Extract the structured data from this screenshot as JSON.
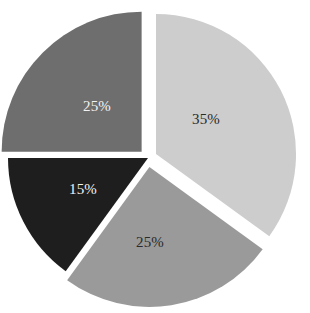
{
  "chart_data": {
    "type": "pie",
    "title": "",
    "subtitle": "",
    "xlabel": "",
    "ylabel": "",
    "legend": "none",
    "grid": false,
    "background_color": "#ffffff",
    "center": {
      "x": 148,
      "y": 158
    },
    "radius": 140,
    "start_angle_deg": 0,
    "direction": "clockwise",
    "exploded": true,
    "categories": [
      "35%",
      "25%",
      "15%",
      "25%"
    ],
    "values": [
      35,
      25,
      15,
      25
    ],
    "labels": [
      "35%",
      "25%",
      "15%",
      "25%"
    ],
    "slices": [
      {
        "label": "35%",
        "value": 35,
        "color": "#cdcdcd",
        "label_color": "#2a2a2a",
        "start_deg": 0,
        "end_deg": 126,
        "explode_deg": 63,
        "explode_px": 9,
        "label_x": 206,
        "label_y": 124,
        "position": "right"
      },
      {
        "label": "25%",
        "value": 25,
        "color": "#9a9a9a",
        "label_color": "#2a2a2a",
        "start_deg": 126,
        "end_deg": 216,
        "explode_deg": 171,
        "explode_px": 9,
        "label_x": 150,
        "label_y": 247,
        "position": "bottom"
      },
      {
        "label": "15%",
        "value": 15,
        "color": "#1e1e1e",
        "label_color": "#f2f2f2",
        "start_deg": 216,
        "end_deg": 270,
        "explode_deg": 243,
        "explode_px": 0,
        "label_x": 83,
        "label_y": 194,
        "position": "lower-left"
      },
      {
        "label": "25%",
        "value": 25,
        "color": "#6e6e6e",
        "label_color": "#f2f2f2",
        "start_deg": 270,
        "end_deg": 360,
        "explode_deg": 315,
        "explode_px": 9,
        "label_x": 97,
        "label_y": 111,
        "position": "upper-left"
      }
    ],
    "total": 100,
    "units": "percent"
  }
}
